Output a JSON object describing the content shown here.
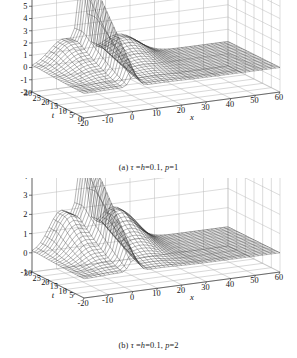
{
  "figure": {
    "background_color": "#ffffff",
    "ink_color": "#1a1a1a",
    "grid_color": "#b9b9b9",
    "mesh_color": "#2b2b2b"
  },
  "panels": [
    {
      "id": "a",
      "caption": "(a) τ =h=0.1, p=1",
      "caption_parts": {
        "index": "(a)",
        "tau": "τ",
        "eq1": " =",
        "h": "h",
        "eq2": "=0.1, ",
        "p": "p",
        "eq3": "=1"
      }
    },
    {
      "id": "b",
      "caption": "(b) τ =h=0.1, p=2",
      "caption_parts": {
        "index": "(b)",
        "tau": "τ",
        "eq1": " =",
        "h": "h",
        "eq2": "=0.1, ",
        "p": "p",
        "eq3": "=2"
      }
    }
  ],
  "chart_data": [
    {
      "type": "surface",
      "panel": "a",
      "title": "(a) τ =h=0.1, p=1",
      "xlabel": "x",
      "ylabel": "t",
      "zlabel": "",
      "xticks": [
        -20,
        -10,
        0,
        10,
        20,
        30,
        40,
        50,
        60
      ],
      "xticklabels": [
        "-20",
        "-10",
        "0",
        "10",
        "20",
        "30",
        "40",
        "50",
        "60"
      ],
      "yticks": [
        0,
        5,
        10,
        15,
        20,
        25,
        30
      ],
      "yticklabels": [
        "0",
        "5",
        "10",
        "15",
        "20",
        "25",
        "30"
      ],
      "zticks": [
        -2,
        -1,
        0,
        1,
        2,
        3,
        4,
        5,
        6
      ],
      "zticklabels": [
        "-2",
        "-1",
        "0",
        "1",
        "2",
        "3",
        "4",
        "5",
        "6"
      ],
      "xlim": [
        -20,
        60
      ],
      "ylim": [
        0,
        30
      ],
      "zlim": [
        -2,
        6
      ],
      "grid": true,
      "legend": null,
      "description": "Mesh surface of a soliton-type solution u(x,t): a tall narrow spike near x=0 reaching about z=6, flanked by two broad lower humps (left hump peaking near z=2 around x=-5..0 at large t, right hump near x=10..25), with the surface flat near z=0 elsewhere.",
      "peak": {
        "x": 0,
        "t": 30,
        "z": 6.0
      },
      "surface_samples": {
        "x": [
          -20,
          -15,
          -10,
          -5,
          -2,
          0,
          2,
          5,
          10,
          15,
          20,
          30,
          40,
          50,
          60
        ],
        "t": [
          0,
          5,
          10,
          15,
          20,
          25,
          30
        ],
        "z": [
          [
            0.0,
            0.0,
            0.02,
            0.12,
            0.45,
            1.0,
            0.45,
            0.12,
            0.02,
            0.0,
            0.0,
            0.0,
            0.0,
            0.0,
            0.0
          ],
          [
            0.0,
            0.01,
            0.06,
            0.3,
            0.95,
            1.85,
            0.95,
            0.35,
            0.08,
            0.02,
            0.0,
            0.0,
            0.0,
            0.0,
            0.0
          ],
          [
            0.0,
            0.02,
            0.1,
            0.55,
            1.55,
            2.9,
            1.5,
            0.6,
            0.18,
            0.05,
            0.01,
            0.0,
            0.0,
            0.0,
            0.0
          ],
          [
            0.0,
            0.03,
            0.16,
            0.8,
            2.15,
            3.9,
            2.05,
            0.9,
            0.32,
            0.1,
            0.03,
            0.0,
            0.0,
            0.0,
            0.0
          ],
          [
            0.0,
            0.05,
            0.24,
            1.05,
            2.7,
            4.7,
            2.55,
            1.2,
            0.5,
            0.18,
            0.06,
            0.01,
            0.0,
            0.0,
            0.0
          ],
          [
            0.0,
            0.07,
            0.34,
            1.3,
            3.15,
            5.45,
            3.0,
            1.5,
            0.7,
            0.28,
            0.1,
            0.02,
            0.0,
            0.0,
            0.0
          ],
          [
            0.0,
            0.09,
            0.45,
            1.55,
            3.55,
            6.0,
            3.4,
            1.8,
            0.9,
            0.38,
            0.15,
            0.03,
            0.0,
            0.0,
            0.0
          ]
        ]
      }
    },
    {
      "type": "surface",
      "panel": "b",
      "title": "(b) τ =h=0.1, p=2",
      "xlabel": "x",
      "ylabel": "t",
      "zlabel": "",
      "xticks": [
        -20,
        -10,
        0,
        10,
        20,
        30,
        40,
        50,
        60
      ],
      "xticklabels": [
        "-20",
        "-10",
        "0",
        "10",
        "20",
        "30",
        "40",
        "50",
        "60"
      ],
      "yticks": [
        5,
        10,
        15,
        20,
        25,
        30
      ],
      "yticklabels": [
        "5",
        "10",
        "15",
        "20",
        "25",
        "30"
      ],
      "zticks": [
        -1,
        0,
        1,
        2,
        3,
        4
      ],
      "zticklabels": [
        "-1",
        "0",
        "1",
        "2",
        "3",
        "4"
      ],
      "xlim": [
        -20,
        60
      ],
      "ylim": [
        0,
        30
      ],
      "zlim": [
        -1,
        4
      ],
      "grid": true,
      "legend": null,
      "description": "Mesh surface of a soliton-type solution u(x,t) for p=2: a tall narrow spike near x=0 reaching about z=4, with a broad rounded hump on the left (x around -8) and a wide shoulder on the right (x around 5..25), flat near z=0 elsewhere.",
      "peak": {
        "x": 0,
        "t": 30,
        "z": 4.0
      },
      "surface_samples": {
        "x": [
          -20,
          -15,
          -10,
          -5,
          -2,
          0,
          2,
          5,
          10,
          15,
          20,
          30,
          40,
          50,
          60
        ],
        "t": [
          0,
          5,
          10,
          15,
          20,
          25,
          30
        ],
        "z": [
          [
            0.0,
            0.0,
            0.03,
            0.15,
            0.5,
            0.95,
            0.5,
            0.15,
            0.03,
            0.0,
            0.0,
            0.0,
            0.0,
            0.0,
            0.0
          ],
          [
            0.0,
            0.02,
            0.12,
            0.45,
            1.05,
            1.7,
            1.0,
            0.45,
            0.12,
            0.03,
            0.0,
            0.0,
            0.0,
            0.0,
            0.0
          ],
          [
            0.0,
            0.04,
            0.28,
            0.8,
            1.55,
            2.4,
            1.5,
            0.8,
            0.3,
            0.08,
            0.02,
            0.0,
            0.0,
            0.0,
            0.0
          ],
          [
            0.0,
            0.06,
            0.45,
            1.1,
            1.95,
            2.95,
            1.9,
            1.1,
            0.5,
            0.16,
            0.04,
            0.0,
            0.0,
            0.0,
            0.0
          ],
          [
            0.0,
            0.09,
            0.62,
            1.38,
            2.25,
            3.35,
            2.2,
            1.4,
            0.72,
            0.26,
            0.08,
            0.01,
            0.0,
            0.0,
            0.0
          ],
          [
            0.0,
            0.12,
            0.78,
            1.6,
            2.5,
            3.7,
            2.45,
            1.65,
            0.92,
            0.36,
            0.13,
            0.02,
            0.0,
            0.0,
            0.0
          ],
          [
            0.0,
            0.15,
            0.92,
            1.78,
            2.7,
            4.0,
            2.65,
            1.85,
            1.08,
            0.46,
            0.18,
            0.03,
            0.0,
            0.0,
            0.0
          ]
        ]
      }
    }
  ]
}
